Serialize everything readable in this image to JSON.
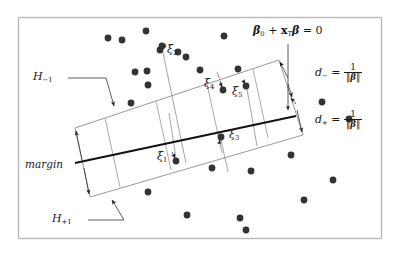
{
  "figure": {
    "frame": {
      "color": "#b9b9b9",
      "x": 18,
      "y": 17,
      "width": 364,
      "height": 222
    },
    "point_color": "#333333",
    "line_color": "#8a8a8a",
    "decision_line_color": "#111111"
  },
  "labels": {
    "hyperplane_equation": {
      "beta0": "β",
      "beta0_sub": "0",
      "plus": "+",
      "x": "x",
      "x_sup": "T",
      "beta": "β",
      "equals": "= 0"
    },
    "h_minus": {
      "letter": "H",
      "sub": "−1"
    },
    "h_plus": {
      "letter": "H",
      "sub": "+1"
    },
    "margin": "margin",
    "d_minus": {
      "letter": "d",
      "sub": "−",
      "equals": "=",
      "num": "1",
      "den_open": "‖",
      "den_beta": "β",
      "den_close": "‖"
    },
    "d_plus": {
      "letter": "d",
      "sub": "+",
      "equals": "=",
      "num": "1",
      "den_open": "‖",
      "den_beta": "β",
      "den_close": "‖"
    },
    "xi": [
      {
        "name": "xi-1",
        "letter": "ξ",
        "sub": "1"
      },
      {
        "name": "xi-2",
        "letter": "ξ",
        "sub": "2"
      },
      {
        "name": "xi-3",
        "letter": "ξ",
        "sub": "3"
      },
      {
        "name": "xi-4",
        "letter": "ξ",
        "sub": "4"
      },
      {
        "name": "xi-5",
        "letter": "ξ",
        "sub": "5"
      }
    ]
  },
  "chart_data": {
    "type": "scatter",
    "xlabel": "",
    "ylabel": "",
    "xlim": [
      0,
      400
    ],
    "ylim": [
      0,
      256
    ],
    "grid": false,
    "legend": null,
    "annotations": [
      {
        "text": "β₀ + xᵀβ = 0",
        "x": 262,
        "y": 34,
        "role": "decision-boundary-equation"
      },
      {
        "text": "H₋₁",
        "x": 48,
        "y": 78,
        "role": "negative-margin-hyperplane"
      },
      {
        "text": "H₊₁",
        "x": 62,
        "y": 222,
        "role": "positive-margin-hyperplane"
      },
      {
        "text": "margin",
        "x": 32,
        "y": 165,
        "role": "margin-label"
      },
      {
        "text": "d₋ = 1/‖β‖",
        "x": 318,
        "y": 72,
        "role": "negative-margin-width"
      },
      {
        "text": "d₊ = 1/‖β‖",
        "x": 318,
        "y": 119,
        "role": "positive-margin-width"
      },
      {
        "text": "ξ₁",
        "x": 163,
        "y": 158,
        "role": "slack-variable"
      },
      {
        "text": "ξ₂",
        "x": 168,
        "y": 52,
        "role": "slack-variable"
      },
      {
        "text": "ξ₃",
        "x": 232,
        "y": 136,
        "role": "slack-variable"
      },
      {
        "text": "ξ₄",
        "x": 209,
        "y": 86,
        "role": "slack-variable"
      },
      {
        "text": "ξ₅",
        "x": 237,
        "y": 94,
        "role": "slack-variable"
      }
    ],
    "decision_boundary": {
      "x1": 75,
      "y1": 163,
      "x2": 296,
      "y2": 116
    },
    "margin_band": {
      "top_left": [
        75,
        128
      ],
      "top_right": [
        279,
        60
      ],
      "bottom_right": [
        303,
        135
      ],
      "bottom_left": [
        90,
        197
      ],
      "h_minus_line": [
        [
          75,
          128
        ],
        [
          279,
          60
        ]
      ],
      "h_plus_line": [
        [
          90,
          197
        ],
        [
          303,
          135
        ]
      ]
    },
    "points": [
      {
        "x": 108,
        "y": 38,
        "class": "class-a"
      },
      {
        "x": 122,
        "y": 40,
        "class": "class-a"
      },
      {
        "x": 146,
        "y": 31,
        "class": "class-a"
      },
      {
        "x": 160,
        "y": 50,
        "class": "class-a"
      },
      {
        "x": 178,
        "y": 52,
        "class": "class-a"
      },
      {
        "x": 135,
        "y": 72,
        "class": "class-a"
      },
      {
        "x": 147,
        "y": 71,
        "class": "class-a"
      },
      {
        "x": 148,
        "y": 85,
        "class": "class-a"
      },
      {
        "x": 224,
        "y": 36,
        "class": "class-a"
      },
      {
        "x": 186,
        "y": 57,
        "class": "class-a"
      },
      {
        "x": 200,
        "y": 70,
        "class": "class-a"
      },
      {
        "x": 238,
        "y": 69,
        "class": "class-a"
      },
      {
        "x": 131,
        "y": 103,
        "class": "class-a"
      },
      {
        "x": 223,
        "y": 90,
        "class": "class-a",
        "slack": "ξ₄"
      },
      {
        "x": 246,
        "y": 86,
        "class": "class-a",
        "slack": "ξ₅"
      },
      {
        "x": 221,
        "y": 137,
        "class": "class-b",
        "slack": "ξ₃"
      },
      {
        "x": 176,
        "y": 161,
        "class": "class-b",
        "slack": "ξ₁"
      },
      {
        "x": 162,
        "y": 46,
        "class": "class-b",
        "slack": "ξ₂"
      },
      {
        "x": 212,
        "y": 168,
        "class": "class-b"
      },
      {
        "x": 251,
        "y": 171,
        "class": "class-b"
      },
      {
        "x": 148,
        "y": 192,
        "class": "class-b"
      },
      {
        "x": 291,
        "y": 155,
        "class": "class-b"
      },
      {
        "x": 304,
        "y": 200,
        "class": "class-b"
      },
      {
        "x": 187,
        "y": 215,
        "class": "class-b"
      },
      {
        "x": 240,
        "y": 218,
        "class": "class-b"
      },
      {
        "x": 246,
        "y": 230,
        "class": "class-b"
      },
      {
        "x": 333,
        "y": 180,
        "class": "class-b"
      },
      {
        "x": 349,
        "y": 119,
        "class": "class-b"
      },
      {
        "x": 322,
        "y": 102,
        "class": "class-b"
      }
    ]
  }
}
